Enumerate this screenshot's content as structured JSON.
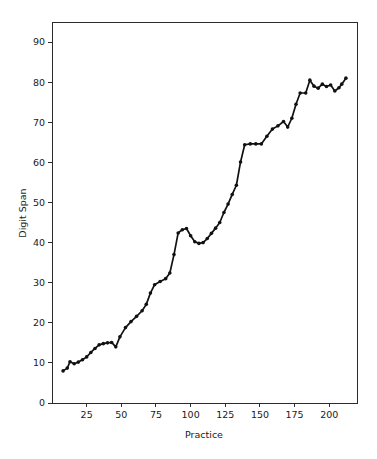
{
  "chart_data": {
    "type": "line",
    "title": "",
    "xlabel": "Practice",
    "ylabel": "Digit Span",
    "xlim": [
      0,
      220
    ],
    "ylim": [
      0,
      95
    ],
    "xticks": [
      25,
      50,
      75,
      100,
      125,
      150,
      175,
      200
    ],
    "yticks": [
      0,
      10,
      20,
      30,
      40,
      50,
      60,
      70,
      80,
      90
    ],
    "grid": false,
    "legend": "none",
    "markers": "filled-circle",
    "series": [
      {
        "name": "Digit Span",
        "x": [
          8,
          11,
          13,
          16,
          19,
          22,
          25,
          28,
          31,
          34,
          37,
          40,
          43,
          46,
          49,
          53,
          57,
          61,
          65,
          68,
          71,
          74,
          78,
          82,
          85,
          88,
          91,
          94,
          97,
          100,
          103,
          106,
          109,
          112,
          115,
          118,
          121,
          124,
          127,
          130,
          133,
          136,
          139,
          143,
          147,
          151,
          155,
          159,
          163,
          167,
          170,
          173,
          176,
          179,
          183,
          186,
          189,
          192,
          195,
          198,
          201,
          204,
          207,
          209,
          212
        ],
        "y": [
          8.0,
          8.7,
          10.3,
          9.8,
          10.2,
          10.8,
          11.5,
          12.6,
          13.6,
          14.5,
          14.8,
          15.0,
          15.1,
          14.0,
          16.5,
          18.8,
          20.3,
          21.6,
          23.0,
          24.6,
          27.4,
          29.5,
          30.3,
          31.0,
          32.4,
          37.0,
          42.4,
          43.2,
          43.5,
          41.7,
          40.2,
          39.8,
          40.0,
          41.0,
          42.3,
          43.6,
          45.0,
          47.5,
          49.6,
          52.0,
          54.3,
          60.1,
          64.4,
          64.6,
          64.6,
          64.6,
          66.5,
          68.3,
          69.1,
          70.2,
          68.8,
          71.0,
          74.5,
          77.3,
          77.3,
          80.5,
          79.0,
          78.5,
          79.5,
          78.9,
          79.3,
          77.8,
          78.6,
          79.5,
          81.0
        ]
      }
    ]
  }
}
